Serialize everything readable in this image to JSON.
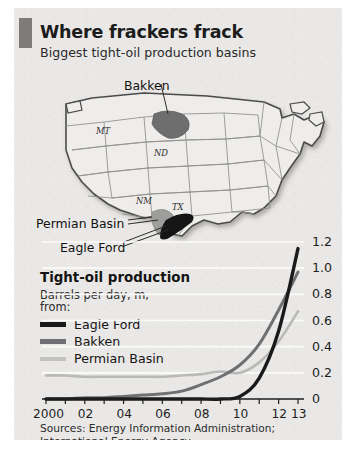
{
  "header": {
    "title": "Where frackers frack",
    "subtitle": "Biggest tight-oil production basins",
    "accent_color": "#7d7c79"
  },
  "map": {
    "state_labels": [
      "MT",
      "ND",
      "NM",
      "TX"
    ],
    "basin_labels": [
      {
        "name": "Bakken",
        "color": "#6e6e6e",
        "position": "north-dakota"
      },
      {
        "name": "Permian Basin",
        "color": "#8a8a8a",
        "position": "west-texas"
      },
      {
        "name": "Eagle Ford",
        "color": "#151515",
        "position": "south-texas"
      }
    ]
  },
  "chart_panel": {
    "title": "Tight-oil production",
    "subtitle_line1": "Barrels per day, m,",
    "subtitle_line2": "from:",
    "legend": [
      {
        "label": "Eagle Ford",
        "color": "#1a1a1a"
      },
      {
        "label": "Bakken",
        "color": "#6f7073"
      },
      {
        "label": "Permian Basin",
        "color": "#b9b9b7"
      }
    ]
  },
  "sources": "Sources: Energy Information Administration;\nInternational Energy Agency",
  "chart_data": {
    "type": "line",
    "title": "Tight-oil production",
    "xlabel": "",
    "ylabel": "Barrels per day, m",
    "ylim": [
      0,
      1.2
    ],
    "xlim": [
      2000,
      2013
    ],
    "grid": true,
    "y_axis_position": "right",
    "legend_position": "left-inside",
    "yticks": [
      "0",
      "0.2",
      "0.4",
      "0.6",
      "0.8",
      "1.0",
      "1.2"
    ],
    "ytick_values": [
      0,
      0.2,
      0.4,
      0.6,
      0.8,
      1.0,
      1.2
    ],
    "xticks": [
      "2000",
      "02",
      "04",
      "06",
      "08",
      "10",
      "12",
      "13"
    ],
    "xtick_values": [
      2000,
      2002,
      2004,
      2006,
      2008,
      2010,
      2012,
      2013
    ],
    "x": [
      2000,
      2001,
      2002,
      2003,
      2004,
      2005,
      2006,
      2007,
      2008,
      2009,
      2010,
      2011,
      2012,
      2013
    ],
    "series": [
      {
        "name": "Eagle Ford",
        "color": "#1a1a1a",
        "values": [
          0.0,
          0.0,
          0.0,
          0.0,
          0.0,
          0.0,
          0.0,
          0.0,
          0.0,
          0.0,
          0.02,
          0.16,
          0.52,
          1.15
        ]
      },
      {
        "name": "Bakken",
        "color": "#6f7073",
        "values": [
          0.0,
          0.0,
          0.01,
          0.01,
          0.02,
          0.03,
          0.04,
          0.06,
          0.11,
          0.17,
          0.26,
          0.42,
          0.68,
          0.97
        ]
      },
      {
        "name": "Permian Basin",
        "color": "#b9b9b7",
        "values": [
          0.18,
          0.18,
          0.17,
          0.17,
          0.17,
          0.17,
          0.17,
          0.18,
          0.19,
          0.21,
          0.2,
          0.28,
          0.44,
          0.67
        ]
      }
    ]
  }
}
